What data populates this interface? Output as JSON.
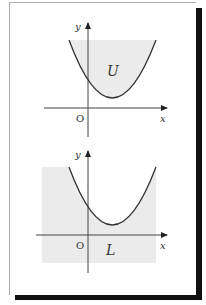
{
  "figure": {
    "colors": {
      "shade": "#ebebeb",
      "curve": "#333333",
      "axis": "#444444",
      "shadow": "#111111"
    },
    "top_graph": {
      "y_label": "y",
      "x_label": "x",
      "origin_label": "O",
      "region_label": "U",
      "description": "Upper region above parabola shaded"
    },
    "bottom_graph": {
      "y_label": "y",
      "x_label": "x",
      "origin_label": "O",
      "region_label": "L",
      "description": "Lower region below parabola shaded"
    }
  }
}
